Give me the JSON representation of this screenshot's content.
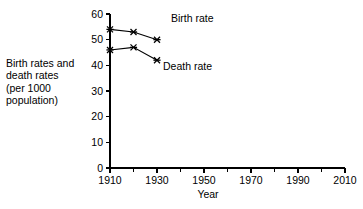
{
  "chart_data": {
    "type": "line",
    "title": "",
    "xlabel": "Year",
    "ylabel": "Birth rates and\ndeath rates\n(per 1000\npopulation)",
    "ylabel_lines": [
      "Birth rates and",
      "death rates",
      "(per 1000",
      "population)"
    ],
    "x": [
      1910,
      1920,
      1930
    ],
    "xlim": [
      1910,
      2010
    ],
    "ylim": [
      0,
      60
    ],
    "xticks": [
      1910,
      1920,
      1930,
      1940,
      1950,
      1960,
      1970,
      1980,
      1990,
      2000,
      2010
    ],
    "xtick_labels": [
      "1910",
      "",
      "1930",
      "",
      "1950",
      "",
      "1970",
      "",
      "1990",
      "",
      "2010"
    ],
    "xtick_labels_major": [
      "1910",
      "1930",
      "1950",
      "1970",
      "1990",
      "2010"
    ],
    "yticks": [
      0,
      10,
      20,
      30,
      40,
      50,
      60
    ],
    "ytick_labels": [
      "0",
      "10",
      "20",
      "30",
      "40",
      "50",
      "60"
    ],
    "grid": false,
    "legend_position": "inline-annotation",
    "marker": "x-star",
    "line_color": "#000000",
    "background_color": "#ffffff",
    "series": [
      {
        "name": "Birth rate",
        "label": "Birth rate",
        "values": [
          54,
          53,
          50
        ],
        "label_x": 1945,
        "label_y": 57
      },
      {
        "name": "Death rate",
        "label": "Death rate",
        "values": [
          46,
          47,
          42
        ],
        "label_x": 1943,
        "label_y": 38
      }
    ]
  }
}
